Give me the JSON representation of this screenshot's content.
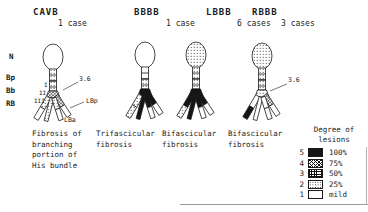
{
  "figure": {
    "panels": [
      {
        "title": "CAVB",
        "cases": "1 case",
        "caption": "Fibrosis of\nbranching\nportion of\nHis bundle"
      },
      {
        "title": "BBBB",
        "cases": "1 case",
        "caption": "Trifascicular\nfibrosis"
      },
      {
        "title": "LBBB",
        "cases": "6 cases",
        "caption": "Bifascicular\nfibrosis"
      },
      {
        "title": "RBBB",
        "cases": "3 cases",
        "caption": "Bifascicular\nfibrosis"
      }
    ],
    "anatomy_labels": [
      "N",
      "Bp",
      "Bb",
      "RB"
    ],
    "annotations": {
      "cavb_measure": "3.6",
      "rbbb_measure": "3.6",
      "lbp": "LBp",
      "lba": "LBa",
      "levels": [
        "I",
        "II",
        "III"
      ]
    },
    "legend": {
      "title": "Degree of\nlesions",
      "rows": [
        {
          "grade": "5",
          "percent": "100%",
          "pattern": "solid"
        },
        {
          "grade": "4",
          "percent": "75%",
          "pattern": "cross"
        },
        {
          "grade": "3",
          "percent": "50%",
          "pattern": "grid"
        },
        {
          "grade": "2",
          "percent": "25%",
          "pattern": "dots"
        },
        {
          "grade": "1",
          "percent": "mild",
          "pattern": "plain"
        }
      ]
    },
    "colors": {
      "ink": "#1b1b1b",
      "background": "#ffffff"
    }
  }
}
